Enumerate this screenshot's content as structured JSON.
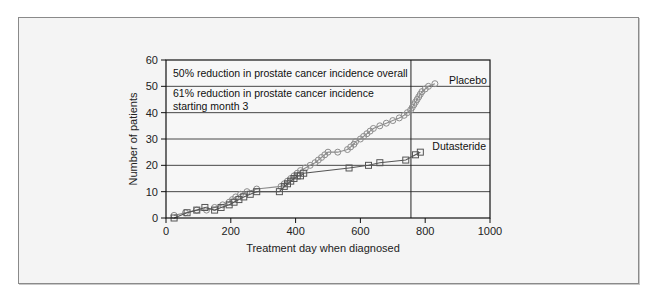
{
  "chart_data": {
    "type": "line",
    "title": "",
    "xlabel": "Treatment day when diagnosed",
    "ylabel": "Number of patients",
    "xlim": [
      0,
      1000
    ],
    "ylim": [
      0,
      60
    ],
    "xticks": [
      0,
      200,
      400,
      600,
      800,
      1000
    ],
    "yticks": [
      0,
      10,
      20,
      30,
      40,
      50,
      60
    ],
    "grid": "horizontal",
    "reference_line_x": 756,
    "annotations": [
      "50% reduction in prostate cancer incidence overall",
      "61% reduction in prostate cancer incidence",
      "starting month 3"
    ],
    "series": [
      {
        "name": "Placebo",
        "marker": "circle",
        "color": "#8c8c8c",
        "x": [
          25,
          60,
          95,
          125,
          150,
          175,
          195,
          205,
          215,
          230,
          250,
          280,
          355,
          365,
          375,
          385,
          395,
          405,
          415,
          430,
          445,
          460,
          470,
          480,
          490,
          500,
          530,
          560,
          570,
          580,
          585,
          600,
          610,
          620,
          630,
          640,
          660,
          680,
          700,
          720,
          735,
          745,
          755,
          760,
          765,
          770,
          775,
          780,
          785,
          790,
          800,
          810,
          830
        ],
        "y": [
          1,
          2,
          3,
          3,
          4,
          5,
          6,
          7,
          8,
          9,
          10,
          11,
          12,
          13,
          14,
          15,
          16,
          17,
          18,
          19,
          20,
          21,
          22,
          23,
          24,
          25,
          25,
          26,
          27,
          28,
          29,
          30,
          31,
          32,
          33,
          34,
          35,
          36,
          37,
          38,
          39,
          40,
          41,
          42,
          43,
          44,
          45,
          46,
          47,
          48,
          49,
          50,
          51
        ]
      },
      {
        "name": "Dutasteride",
        "marker": "square",
        "color": "#555555",
        "x": [
          25,
          65,
          95,
          120,
          150,
          170,
          195,
          210,
          225,
          240,
          260,
          280,
          350,
          365,
          375,
          385,
          395,
          405,
          415,
          425,
          565,
          625,
          660,
          740,
          770,
          785
        ],
        "y": [
          0,
          2,
          3,
          4,
          3,
          4,
          5,
          6,
          7,
          8,
          9,
          10,
          10,
          12,
          13,
          14,
          15,
          16,
          16,
          17,
          19,
          20,
          21,
          22,
          24,
          25
        ]
      }
    ]
  }
}
